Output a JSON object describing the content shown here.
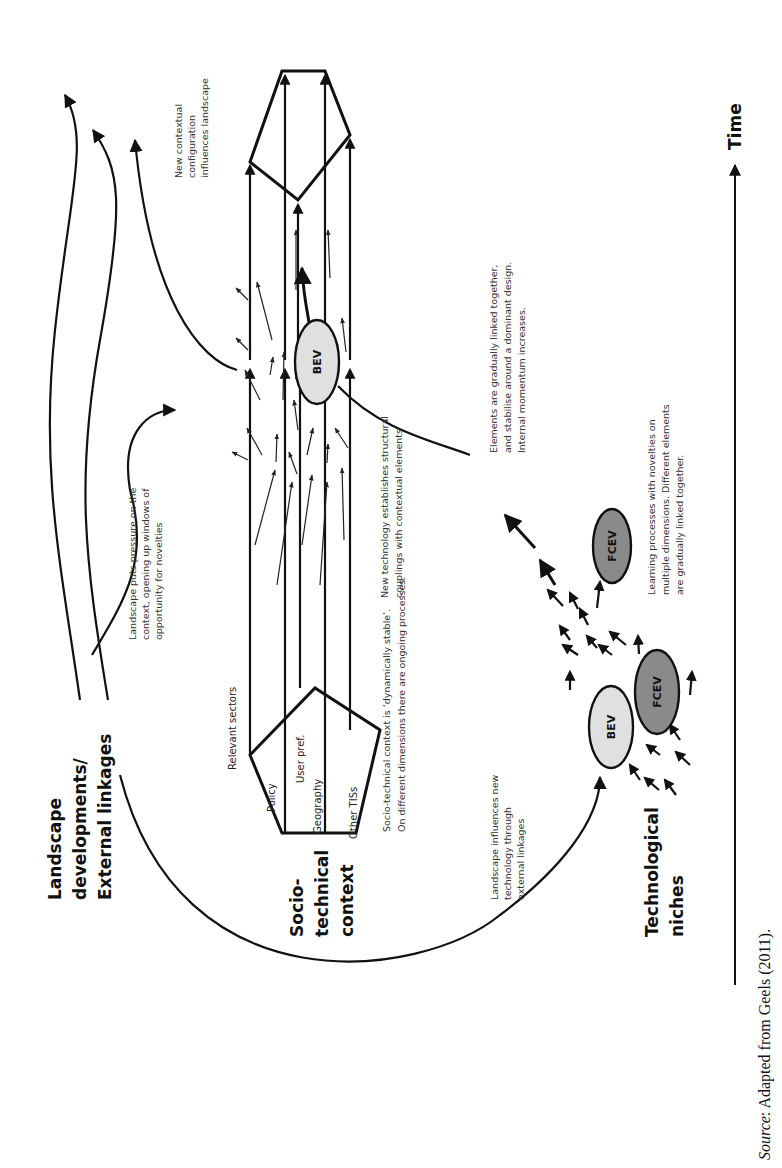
{
  "figure": {
    "orientation": "rotated 90 degrees counter-clockwise",
    "levels": {
      "landscape": [
        "Landscape",
        "developments/",
        "External linkages"
      ],
      "regime": [
        "Socio-",
        "technical",
        "context"
      ],
      "niche": [
        "Technological",
        "niches"
      ]
    },
    "axis": {
      "label": "Time"
    },
    "dimensions": {
      "relevant_sectors": "Relevant sectors",
      "policy": "Policy",
      "user_pref": "User pref.",
      "geography": "Geography",
      "other_tiss": "Other TISs"
    },
    "nodes": {
      "bev_niche": "BEV",
      "fcev_niche": "FCEV",
      "bev_regime": "BEV",
      "fcev_later": "FCEV"
    },
    "colors": {
      "bev_fill": "#e0e0e0",
      "fcev_fill": "#8a8a8a",
      "stroke": "#111111"
    },
    "annotations": {
      "landscape_pressure": [
        "Landscape puts pressure on the",
        "context, opening up windows of",
        "opportunity for novelties"
      ],
      "new_config": [
        "New contextual",
        "configuration",
        "influences landscape"
      ],
      "dynamically_stable": [
        "Socio-technical context is ‘dynamically stable’.",
        "On different dimensions there are ongoing processes."
      ],
      "new_technology": [
        "New technology establishes structural",
        "couplings with contextual elements"
      ],
      "elements_linked": [
        "Elements are gradually linked together,",
        "and stabilise around a dominant design.",
        "Internal momentum increases."
      ],
      "learning": [
        "Learning processes with novelties on",
        "multiple dimensions. Different elements",
        "are gradually linked together."
      ],
      "landscape_influences": [
        "Landscape influences new",
        "technology through",
        "external linkages"
      ]
    },
    "caption": {
      "source_label": "Source",
      "text": ": Adapted from Geels (2011)."
    }
  }
}
